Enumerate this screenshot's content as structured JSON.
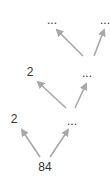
{
  "diagram": {
    "type": "tree",
    "colors": {
      "edge": "#a8a8a8",
      "text": "#333333",
      "background": "#ffffff"
    },
    "nodes": [
      {
        "id": "root",
        "label": "84",
        "x": 45,
        "y": 170
      },
      {
        "id": "l1_left",
        "label": "2",
        "x": 14,
        "y": 122
      },
      {
        "id": "l1_right",
        "label": "...",
        "x": 72,
        "y": 124
      },
      {
        "id": "l2_left",
        "label": "2",
        "x": 30,
        "y": 75
      },
      {
        "id": "l2_right",
        "label": "...",
        "x": 87,
        "y": 76
      },
      {
        "id": "l3_left",
        "label": "...",
        "x": 52,
        "y": 23
      },
      {
        "id": "l3_right",
        "label": "...",
        "x": 106,
        "y": 23
      }
    ],
    "edges": [
      {
        "from": "root",
        "to": "l1_left"
      },
      {
        "from": "root",
        "to": "l1_right"
      },
      {
        "from": "l1_right",
        "to": "l2_left"
      },
      {
        "from": "l1_right",
        "to": "l2_right"
      },
      {
        "from": "l2_right",
        "to": "l3_left"
      },
      {
        "from": "l2_right",
        "to": "l3_right"
      }
    ]
  }
}
